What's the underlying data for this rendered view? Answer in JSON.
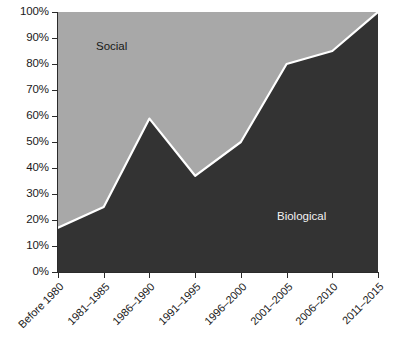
{
  "chart_data": {
    "type": "area",
    "stacked": true,
    "title": "",
    "xlabel": "",
    "ylabel": "",
    "ylim": [
      0,
      100
    ],
    "y_unit": "%",
    "grid": false,
    "legend_position": "inside-areas",
    "categories": [
      "Before 1980",
      "1981–1985",
      "1986–1990",
      "1991–1995",
      "1996–2000",
      "2001–2005",
      "2006–2010",
      "2011–2015"
    ],
    "series": [
      {
        "name": "Biological",
        "color": "#333333",
        "label_color": "#f2f2f2",
        "values": [
          17,
          25,
          59,
          37,
          50,
          80,
          85,
          100
        ]
      },
      {
        "name": "Social",
        "color": "#a8a8a8",
        "label_color": "#181818",
        "values": [
          83,
          75,
          41,
          63,
          50,
          20,
          15,
          0
        ]
      }
    ],
    "y_ticks": [
      "0%",
      "10%",
      "20%",
      "30%",
      "40%",
      "50%",
      "60%",
      "70%",
      "80%",
      "90%",
      "100%"
    ],
    "y_tick_values": [
      0,
      10,
      20,
      30,
      40,
      50,
      60,
      70,
      80,
      90,
      100
    ],
    "boundary_line_color": "#ffffff",
    "axis_color": "#2b2b2b",
    "background_color": "#ffffff"
  }
}
